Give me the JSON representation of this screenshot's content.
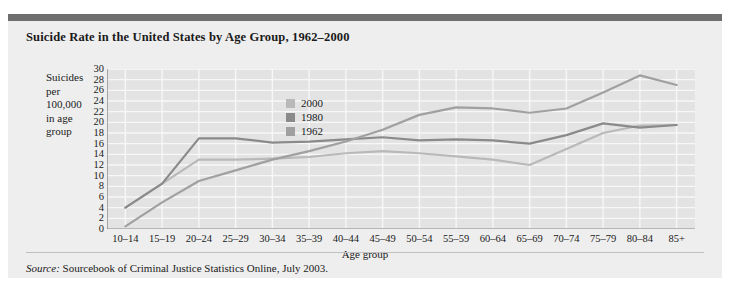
{
  "figure": {
    "title": "Suicide Rate in the United States by Age Group, 1962–2000",
    "source_word": "Source:",
    "source_text": " Sourcebook of Criminal Justice Statistics Online, July 2003."
  },
  "axis_label_lines": [
    "Suicides",
    "per",
    "100,000",
    "in age",
    "group"
  ],
  "colors": {
    "panel_background": "#eeeeee",
    "top_rule": "#6e6e6e",
    "plot_background": "#e3e3e3",
    "gridline": "#f7f7f7",
    "axis": "#7a7a7a",
    "series_2000": "#b9b9b9",
    "series_1980": "#8a8a8a",
    "series_1962": "#a0a0a0",
    "text": "#1a1a1a"
  },
  "chart_data": {
    "type": "line",
    "title": "Suicide Rate in the United States by Age Group, 1962–2000",
    "xlabel": "Age group",
    "ylabel": "Suicides per 100,000 in age group",
    "categories": [
      "10–14",
      "15–19",
      "20–24",
      "25–29",
      "30–34",
      "35–39",
      "40–44",
      "45–49",
      "50–54",
      "55–59",
      "60–64",
      "65–69",
      "70–74",
      "75–79",
      "80–84",
      "85+"
    ],
    "ylim": [
      0,
      30
    ],
    "yticks": [
      0,
      2,
      4,
      6,
      8,
      10,
      12,
      14,
      16,
      18,
      20,
      22,
      24,
      26,
      28,
      30
    ],
    "xlim_note": "categorical, 16 age groups",
    "grid": true,
    "legend_position": "upper-center-left",
    "series": [
      {
        "name": "2000",
        "color": "#b9b9b9",
        "values": [
          4.0,
          8.5,
          13.0,
          13.0,
          13.2,
          13.5,
          14.2,
          14.6,
          14.2,
          13.6,
          13.0,
          12.0,
          15.0,
          18.0,
          19.4,
          19.5
        ]
      },
      {
        "name": "1980",
        "color": "#8a8a8a",
        "values": [
          4.0,
          8.5,
          17.0,
          17.0,
          16.2,
          16.4,
          16.8,
          17.2,
          16.6,
          16.8,
          16.6,
          16.0,
          17.6,
          19.8,
          19.0,
          19.5
        ]
      },
      {
        "name": "1962",
        "color": "#a0a0a0",
        "values": [
          0.5,
          5.0,
          9.0,
          11.0,
          13.0,
          14.6,
          16.4,
          18.6,
          21.4,
          22.8,
          22.6,
          21.8,
          22.6,
          25.6,
          28.8,
          27.0
        ]
      }
    ]
  }
}
